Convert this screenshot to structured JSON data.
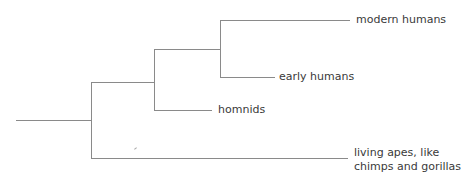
{
  "diagram": {
    "type": "phylogenetic-tree",
    "line_color": "#8a8a8a",
    "text_color": "#3a3a3a",
    "leaves": [
      {
        "id": "modern",
        "label": "modern humans"
      },
      {
        "id": "early",
        "label": "early humans"
      },
      {
        "id": "hominids",
        "label": "homnids"
      },
      {
        "id": "apes",
        "label_line1": "living apes, like",
        "label_line2": "chimps and gorillas"
      }
    ],
    "structure": "((((modern humans, early humans), homnids), living apes))"
  }
}
